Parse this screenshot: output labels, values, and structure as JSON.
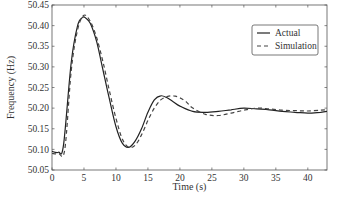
{
  "chart_data": {
    "type": "line",
    "title": "",
    "xlabel": "Time (s)",
    "ylabel": "Frequency (Hz)",
    "xlim": [
      0,
      43
    ],
    "ylim": [
      50.05,
      50.45
    ],
    "xticks": [
      0,
      5,
      10,
      15,
      20,
      25,
      30,
      35,
      40
    ],
    "yticks": [
      50.05,
      50.1,
      50.15,
      50.2,
      50.25,
      50.3,
      50.35,
      50.4,
      50.45
    ],
    "ytick_labels": [
      "50.05",
      "50.10",
      "50.15",
      "50.20",
      "50.25",
      "50.30",
      "50.35",
      "50.40",
      "50.45"
    ],
    "grid": false,
    "legend_position": "upper right",
    "series": [
      {
        "name": "Actual",
        "style": "solid",
        "color": "#222222",
        "x": [
          0,
          1,
          1.8,
          3,
          4,
          4.8,
          5.3,
          6,
          7,
          8,
          9,
          10,
          11,
          12,
          13,
          14,
          15,
          16,
          17,
          18,
          19,
          20,
          22,
          24,
          26,
          28,
          30,
          32,
          34,
          36,
          38,
          40,
          42,
          43
        ],
        "y": [
          50.095,
          50.093,
          50.11,
          50.31,
          50.4,
          50.42,
          50.418,
          50.405,
          50.36,
          50.29,
          50.22,
          50.155,
          50.115,
          50.105,
          50.12,
          50.15,
          50.19,
          50.22,
          50.23,
          50.225,
          50.215,
          50.205,
          50.192,
          50.19,
          50.192,
          50.196,
          50.2,
          50.198,
          50.196,
          50.192,
          50.19,
          50.188,
          50.19,
          50.192
        ]
      },
      {
        "name": "Simulation",
        "style": "dashed",
        "color": "#444444",
        "x": [
          0,
          1,
          2,
          3,
          4,
          5,
          6,
          7,
          8,
          9,
          10,
          11,
          12,
          13,
          14,
          15,
          16,
          17,
          18,
          19,
          20,
          21,
          22,
          24,
          26,
          28,
          30,
          32,
          34,
          36,
          38,
          40,
          42,
          43
        ],
        "y": [
          50.09,
          50.09,
          50.1,
          50.29,
          50.39,
          50.425,
          50.41,
          50.37,
          50.31,
          50.24,
          50.175,
          50.125,
          50.105,
          50.11,
          50.135,
          50.17,
          50.2,
          50.22,
          50.228,
          50.23,
          50.225,
          50.215,
          50.2,
          50.185,
          50.182,
          50.188,
          50.195,
          50.2,
          50.198,
          50.195,
          50.194,
          50.193,
          50.195,
          50.196
        ]
      }
    ]
  },
  "legend": {
    "items": [
      {
        "label": "Actual",
        "style": "solid"
      },
      {
        "label": "Simulation",
        "style": "dashed"
      }
    ]
  },
  "axes": {
    "xlabel": "Time (s)",
    "ylabel": "Frequency (Hz)"
  }
}
